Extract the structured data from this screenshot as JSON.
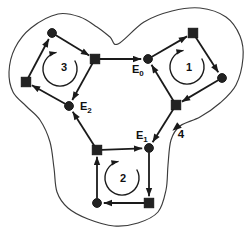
{
  "figure": {
    "width": 247,
    "height": 235,
    "background_color": "#ffffff",
    "ink_color": "#1a1a1a",
    "boundary_color": "#3c3c3c"
  },
  "nodes": [
    {
      "id": "c3t",
      "shape": "circle",
      "x": 52,
      "y": 33
    },
    {
      "id": "s3r",
      "shape": "square",
      "x": 95,
      "y": 59
    },
    {
      "id": "s3l",
      "shape": "square",
      "x": 26,
      "y": 82
    },
    {
      "id": "e2",
      "shape": "circle",
      "x": 69,
      "y": 106,
      "label": {
        "base": "E",
        "sub": "2",
        "lx": 80,
        "ly": 110
      }
    },
    {
      "id": "e0",
      "shape": "circle",
      "x": 148,
      "y": 59,
      "label": {
        "base": "E",
        "sub": "0",
        "lx": 132,
        "ly": 73
      }
    },
    {
      "id": "s1t",
      "shape": "square",
      "x": 193,
      "y": 33
    },
    {
      "id": "c1r",
      "shape": "circle",
      "x": 222,
      "y": 78
    },
    {
      "id": "s1b",
      "shape": "square",
      "x": 176,
      "y": 105
    },
    {
      "id": "e1",
      "shape": "circle",
      "x": 149,
      "y": 148,
      "label": {
        "base": "E",
        "sub": "1",
        "lx": 136,
        "ly": 139
      }
    },
    {
      "id": "s2tl",
      "shape": "square",
      "x": 97,
      "y": 150
    },
    {
      "id": "s2br",
      "shape": "square",
      "x": 149,
      "y": 203
    },
    {
      "id": "c2bl",
      "shape": "circle",
      "x": 97,
      "y": 203
    }
  ],
  "edges": [
    {
      "from": "s3l",
      "to": "c3t"
    },
    {
      "from": "c3t",
      "to": "s3r"
    },
    {
      "from": "s3r",
      "to": "e2"
    },
    {
      "from": "e2",
      "to": "s3l"
    },
    {
      "from": "s3r",
      "to": "e0"
    },
    {
      "from": "e0",
      "to": "s1t"
    },
    {
      "from": "s1t",
      "to": "c1r"
    },
    {
      "from": "c1r",
      "to": "s1b"
    },
    {
      "from": "s1b",
      "to": "e0"
    },
    {
      "from": "s1b",
      "to": "e1"
    },
    {
      "from": "e1",
      "to": "s2br"
    },
    {
      "from": "s2br",
      "to": "c2bl"
    },
    {
      "from": "c2bl",
      "to": "s2tl"
    },
    {
      "from": "s2tl",
      "to": "e1"
    },
    {
      "from": "s2tl",
      "to": "e2"
    }
  ],
  "loops": [
    {
      "label": "1",
      "direction": "clockwise",
      "cx": 187,
      "cy": 67,
      "r": 17,
      "label_x": 189,
      "label_y": 71
    },
    {
      "label": "2",
      "direction": "clockwise",
      "cx": 122,
      "cy": 178,
      "r": 17,
      "label_x": 123,
      "label_y": 182
    },
    {
      "label": "3",
      "direction": "clockwise",
      "cx": 60,
      "cy": 69,
      "r": 17,
      "label_x": 64,
      "label_y": 71
    }
  ],
  "boundary": {
    "label": "4",
    "label_x": 181,
    "label_y": 138,
    "direction": "clockwise",
    "arrow": {
      "x": 177,
      "y": 127,
      "angle": 140
    },
    "points": [
      [
        118,
        44
      ],
      [
        144,
        22
      ],
      [
        172,
        11
      ],
      [
        200,
        8
      ],
      [
        226,
        17
      ],
      [
        240,
        36
      ],
      [
        243,
        58
      ],
      [
        236,
        85
      ],
      [
        220,
        103
      ],
      [
        200,
        117
      ],
      [
        180,
        126
      ],
      [
        171,
        140
      ],
      [
        168,
        165
      ],
      [
        166,
        190
      ],
      [
        158,
        212
      ],
      [
        138,
        223
      ],
      [
        114,
        226
      ],
      [
        88,
        219
      ],
      [
        68,
        208
      ],
      [
        57,
        192
      ],
      [
        54,
        168
      ],
      [
        50,
        142
      ],
      [
        40,
        120
      ],
      [
        26,
        106
      ],
      [
        13,
        92
      ],
      [
        9,
        72
      ],
      [
        15,
        48
      ],
      [
        31,
        28
      ],
      [
        58,
        14
      ],
      [
        80,
        17
      ],
      [
        97,
        27
      ],
      [
        110,
        37
      ]
    ]
  }
}
